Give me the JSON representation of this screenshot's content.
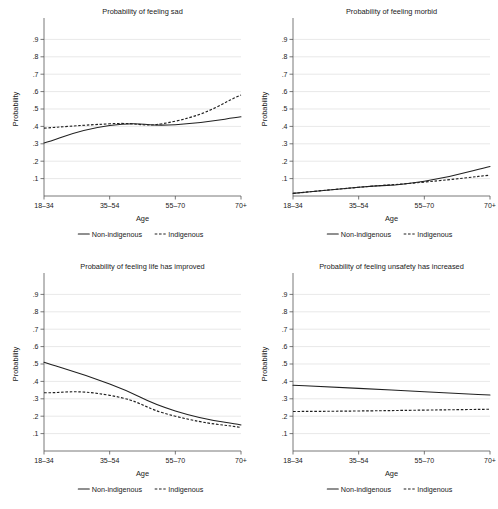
{
  "figure": {
    "axis_x_title": "Age",
    "axis_y_title": "Probability",
    "legend": {
      "solid_label": "Non-indigenous",
      "dashed_label": "Indigenous"
    },
    "x_categories": [
      "18–34",
      "35–54",
      "55–70",
      "70+"
    ],
    "y_ticks": [
      ".1",
      ".2",
      ".3",
      ".4",
      ".5",
      ".6",
      ".7",
      ".8",
      ".9"
    ],
    "colors": {
      "line": "#202020",
      "grid": "#d9d9d9",
      "axis": "#555555",
      "background": "#ffffff"
    }
  },
  "chart_data": [
    {
      "type": "line",
      "title": "Probability of feeling sad",
      "xlabel": "Age",
      "ylabel": "Probability",
      "categories": [
        "18–34",
        "35–54",
        "55–70",
        "70+"
      ],
      "ylim": [
        0,
        1
      ],
      "yticks": [
        0.1,
        0.2,
        0.3,
        0.4,
        0.5,
        0.6,
        0.7,
        0.8,
        0.9
      ],
      "grid": true,
      "legend_position": "below",
      "series": [
        {
          "name": "Non-indigenous",
          "style": "solid",
          "values": [
            0.305,
            0.405,
            0.41,
            0.455
          ]
        },
        {
          "name": "Indigenous",
          "style": "dashed",
          "values": [
            0.39,
            0.415,
            0.43,
            0.58
          ]
        }
      ]
    },
    {
      "type": "line",
      "title": "Probability of feeling morbid",
      "xlabel": "Age",
      "ylabel": "Probability",
      "categories": [
        "18–34",
        "35–54",
        "55–70",
        "70+"
      ],
      "ylim": [
        0,
        1
      ],
      "yticks": [
        0.1,
        0.2,
        0.3,
        0.4,
        0.5,
        0.6,
        0.7,
        0.8,
        0.9
      ],
      "grid": true,
      "legend_position": "below",
      "series": [
        {
          "name": "Non-indigenous",
          "style": "solid",
          "values": [
            0.015,
            0.05,
            0.085,
            0.17
          ]
        },
        {
          "name": "Indigenous",
          "style": "dashed",
          "values": [
            0.015,
            0.05,
            0.08,
            0.12
          ]
        }
      ]
    },
    {
      "type": "line",
      "title": "Probability of feeling life has improved",
      "xlabel": "Age",
      "ylabel": "Probability",
      "categories": [
        "18–34",
        "35–54",
        "55–70",
        "70+"
      ],
      "ylim": [
        0,
        1
      ],
      "yticks": [
        0.1,
        0.2,
        0.3,
        0.4,
        0.5,
        0.6,
        0.7,
        0.8,
        0.9
      ],
      "grid": true,
      "legend_position": "below",
      "series": [
        {
          "name": "Non-indigenous",
          "style": "solid",
          "values": [
            0.51,
            0.385,
            0.23,
            0.15
          ]
        },
        {
          "name": "Indigenous",
          "style": "dashed",
          "values": [
            0.335,
            0.32,
            0.2,
            0.135
          ]
        }
      ]
    },
    {
      "type": "line",
      "title": "Probability of feeling unsafety has increased",
      "xlabel": "Age",
      "ylabel": "Probability",
      "categories": [
        "18–34",
        "35–54",
        "55–70",
        "70+"
      ],
      "ylim": [
        0,
        1
      ],
      "yticks": [
        0.1,
        0.2,
        0.3,
        0.4,
        0.5,
        0.6,
        0.7,
        0.8,
        0.9
      ],
      "grid": true,
      "legend_position": "below",
      "series": [
        {
          "name": "Non-indigenous",
          "style": "solid",
          "values": [
            0.378,
            0.36,
            0.34,
            0.322
          ]
        },
        {
          "name": "Indigenous",
          "style": "dashed",
          "values": [
            0.227,
            0.23,
            0.235,
            0.24
          ]
        }
      ]
    }
  ]
}
